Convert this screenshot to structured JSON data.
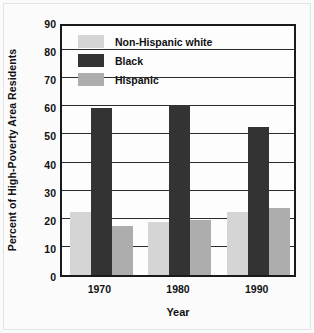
{
  "chart_data": {
    "type": "bar",
    "title": "",
    "xlabel": "Year",
    "ylabel": "Percent of High-Poverty Area Residents",
    "categories": [
      "1970",
      "1980",
      "1990"
    ],
    "series": [
      {
        "name": "Non-Hispanic white",
        "color": "#d5d5d5",
        "values": [
          22.5,
          19,
          22.5
        ]
      },
      {
        "name": "Black",
        "color": "#333333",
        "values": [
          59.5,
          60.5,
          52.5
        ]
      },
      {
        "name": "Hispanic",
        "color": "#adadad",
        "values": [
          17.5,
          19.5,
          24
        ]
      }
    ],
    "ylim": [
      0,
      90
    ],
    "ytick_step": 10,
    "yticks": [
      "90",
      "80",
      "70",
      "60",
      "50",
      "40",
      "30",
      "20",
      "10",
      "0"
    ],
    "grid": true,
    "legend_position": "top-left-inside"
  },
  "legend": {
    "items": [
      {
        "label": "Non-Hispanic white"
      },
      {
        "label": "Black"
      },
      {
        "label": "Hispanic"
      }
    ]
  },
  "axes": {
    "y_title": "Percent of High-Poverty Area Residents",
    "x_title": "Year"
  }
}
